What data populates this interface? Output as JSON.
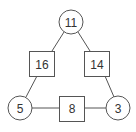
{
  "diagram": {
    "type": "number-triangle",
    "colors": {
      "stroke": "#555555",
      "text": "#333333",
      "background": "#ffffff"
    },
    "circles": [
      {
        "id": "top",
        "value": "11",
        "cx": 71,
        "cy": 22,
        "r": 12
      },
      {
        "id": "bottom-left",
        "value": "5",
        "cx": 20,
        "cy": 108,
        "r": 12
      },
      {
        "id": "bottom-right",
        "value": "3",
        "cx": 118,
        "cy": 108,
        "r": 12
      }
    ],
    "squares": [
      {
        "id": "left",
        "value": "16",
        "x": 29,
        "y": 51,
        "w": 25,
        "h": 25
      },
      {
        "id": "right",
        "value": "14",
        "x": 84,
        "y": 51,
        "w": 25,
        "h": 25
      },
      {
        "id": "bottom",
        "value": "8",
        "x": 59,
        "y": 96,
        "w": 26,
        "h": 25
      }
    ],
    "edges": [
      {
        "from": "top",
        "to": "left"
      },
      {
        "from": "top",
        "to": "right"
      },
      {
        "from": "left",
        "to": "bottom-left"
      },
      {
        "from": "right",
        "to": "bottom-right"
      },
      {
        "from": "bottom-left",
        "to": "bottom"
      },
      {
        "from": "bottom",
        "to": "bottom-right"
      }
    ]
  }
}
